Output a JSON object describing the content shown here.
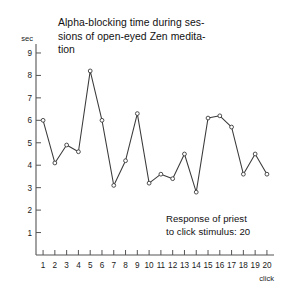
{
  "title": {
    "line1": "Alpha-blocking time during ses-",
    "line2": "sions of open-eyed Zen medita-",
    "line3": "tion"
  },
  "annotation": {
    "line1": "Response of priest",
    "line2": "to click stimulus: 20"
  },
  "axes": {
    "y_unit_label": "sec",
    "x_unit_label": "click"
  },
  "chart_data": {
    "type": "line",
    "subtitle": "Response of priest to click stimulus: 20",
    "xlabel": "click",
    "ylabel": "sec",
    "x": [
      1,
      2,
      3,
      4,
      5,
      6,
      7,
      8,
      9,
      10,
      11,
      12,
      13,
      14,
      15,
      16,
      17,
      18,
      19,
      20
    ],
    "values": [
      6.0,
      4.1,
      4.9,
      4.6,
      8.2,
      6.0,
      3.1,
      4.2,
      6.3,
      3.2,
      3.6,
      3.4,
      4.5,
      2.8,
      6.1,
      6.2,
      5.7,
      3.6,
      4.5,
      3.6
    ],
    "xticklabels": [
      "1",
      "2",
      "3",
      "4",
      "5",
      "6",
      "7",
      "8",
      "9",
      "10",
      "11",
      "12",
      "13",
      "14",
      "15",
      "16",
      "17",
      "18",
      "19",
      "20"
    ],
    "yticklabels": [
      "1",
      "2",
      "3",
      "4",
      "5",
      "6",
      "7",
      "8",
      "9"
    ],
    "ytickvalues": [
      1,
      2,
      3,
      4,
      5,
      6,
      7,
      8,
      9
    ],
    "xlim": [
      0.4,
      20.6
    ],
    "ylim": [
      0,
      9.4
    ],
    "grid": false,
    "legend": false,
    "marker": "open-circle",
    "line_color": "#3a3a3a"
  }
}
